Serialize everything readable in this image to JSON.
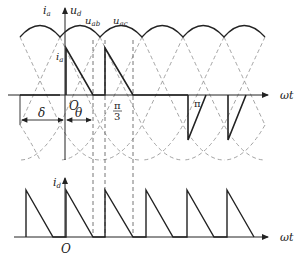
{
  "diagram": {
    "top_panel": {
      "y_axis_labels": {
        "ia": "i",
        "ia_sub": "a",
        "ud": "u",
        "ud_sub": "d"
      },
      "curve_labels": [
        {
          "text": "u",
          "sub": "ab"
        },
        {
          "text": "u",
          "sub": "ac"
        }
      ],
      "current_label": {
        "text": "i",
        "sub": "a"
      },
      "x_axis_label": "ωt",
      "origin_label": "O",
      "angle_labels": {
        "delta": "δ",
        "theta": "θ"
      },
      "tick_labels": {
        "pi_over_3_num": "π",
        "pi_over_3_den": "3",
        "pi": "π"
      }
    },
    "bottom_panel": {
      "y_axis_label": {
        "text": "i",
        "sub": "d"
      },
      "x_axis_label": "ωt",
      "origin_label": "O"
    },
    "colors": {
      "line": "#222222",
      "dashed": "#888888"
    }
  }
}
